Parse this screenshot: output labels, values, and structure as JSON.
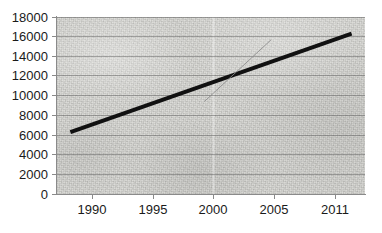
{
  "chart_data": {
    "type": "line",
    "title": "",
    "subtitle": "",
    "xlabel": "",
    "ylabel": "",
    "xlim": [
      1989,
      2012
    ],
    "ylim": [
      0,
      18000
    ],
    "grid": true,
    "grid_axis": "y",
    "legend": false,
    "legend_position": "none",
    "x_tick_labels": [
      "1990",
      "1995",
      "2000",
      "2005",
      "2011"
    ],
    "x_tick_values": [
      1990,
      1995,
      2000,
      2005,
      2011
    ],
    "y_tick_labels": [
      "0",
      "2000",
      "4000",
      "6000",
      "8000",
      "10000",
      "12000",
      "14000",
      "16000",
      "18000"
    ],
    "y_tick_values": [
      0,
      2000,
      4000,
      6000,
      8000,
      10000,
      12000,
      14000,
      16000,
      18000
    ],
    "series": [
      {
        "name": "trend-line",
        "style": "thick-black-line",
        "color": "#111111",
        "width": 4,
        "x": [
          1990,
          2011
        ],
        "values": [
          6300,
          16300
        ]
      },
      {
        "name": "steep-segment",
        "style": "thin-gray-line",
        "color": "#8b8b8b",
        "width": 1,
        "x": [
          2000,
          2005
        ],
        "values": [
          9400,
          15700
        ]
      }
    ],
    "annotations": []
  },
  "colors": {
    "plot_background": "#d8d8d4",
    "page_background": "#ffffff",
    "gridline": "#5a5a5a",
    "axis": "#8a8a8a",
    "tick_text": "#1a1a1a",
    "series_primary": "#111111",
    "series_secondary": "#8b8b8b"
  }
}
